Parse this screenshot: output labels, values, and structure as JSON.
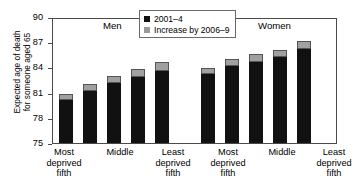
{
  "chart_data": {
    "type": "bar",
    "title": "",
    "subtitle": "",
    "xlabel": "",
    "ylabel": "Expected age of death for someone aged 65",
    "ylabel_lines": [
      "Expected age of death",
      "for someone aged 65"
    ],
    "ylim": [
      75,
      90
    ],
    "yticks": [
      75,
      78,
      81,
      84,
      87,
      90
    ],
    "ytick_labels": [
      "75",
      "78",
      "81",
      "84",
      "87",
      "90"
    ],
    "grid": false,
    "stacked": true,
    "legend_position": "top-center",
    "legend": [
      {
        "label": "2001–4",
        "color": "#111111",
        "marker": "square"
      },
      {
        "label": "Increase by 2006–9",
        "color": "#9a9a9a",
        "marker": "square"
      }
    ],
    "groups": [
      {
        "name": "Men",
        "categories": [
          "Most deprived fifth",
          "",
          "Middle",
          "",
          "Least deprived fifth"
        ],
        "category_lines": [
          [
            "Most",
            "deprived",
            "fifth"
          ],
          [
            ""
          ],
          [
            "Middle"
          ],
          [
            ""
          ],
          [
            "Least",
            "deprived",
            "fifth"
          ]
        ],
        "series": [
          {
            "name": "2001–4",
            "values": [
              80.1,
              81.2,
              82.1,
              82.9,
              83.6
            ]
          },
          {
            "name": "Increase by 2006–9",
            "values": [
              0.7,
              0.8,
              0.9,
              0.9,
              1.0
            ]
          }
        ],
        "totals": [
          80.8,
          82.0,
          83.0,
          83.8,
          84.6
        ]
      },
      {
        "name": "Women",
        "categories": [
          "Most deprived fifth",
          "",
          "Middle",
          "",
          "Least deprived fifth"
        ],
        "category_lines": [
          [
            "Most",
            "deprived",
            "fifth"
          ],
          [
            ""
          ],
          [
            "Middle"
          ],
          [
            ""
          ],
          [
            "Least",
            "deprived",
            "fifth"
          ]
        ],
        "series": [
          {
            "name": "2001–4",
            "values": [
              83.2,
              84.2,
              84.6,
              85.2,
              86.2
            ]
          },
          {
            "name": "Increase by 2006–9",
            "values": [
              0.7,
              0.8,
              1.0,
              0.9,
              0.9
            ]
          }
        ],
        "totals": [
          83.9,
          85.0,
          85.6,
          86.1,
          87.1
        ]
      }
    ]
  },
  "axis": {
    "y_title_line1": "Expected age of death",
    "y_title_line2": "for someone aged 65",
    "tick_75": "75",
    "tick_78": "78",
    "tick_81": "81",
    "tick_84": "84",
    "tick_87": "87",
    "tick_90": "90"
  },
  "legend": {
    "item1": "2001–4",
    "item2": "Increase by 2006–9"
  },
  "groups": {
    "men": "Men",
    "women": "Women"
  },
  "xlabels": {
    "most_l1": "Most",
    "most_l2": "deprived",
    "most_l3": "fifth",
    "middle": "Middle",
    "least_l1": "Least",
    "least_l2": "deprived",
    "least_l3": "fifth"
  },
  "colors": {
    "series1": "#111111",
    "series2": "#9a9a9a",
    "axis": "#4a4a4a",
    "background": "#ffffff"
  }
}
